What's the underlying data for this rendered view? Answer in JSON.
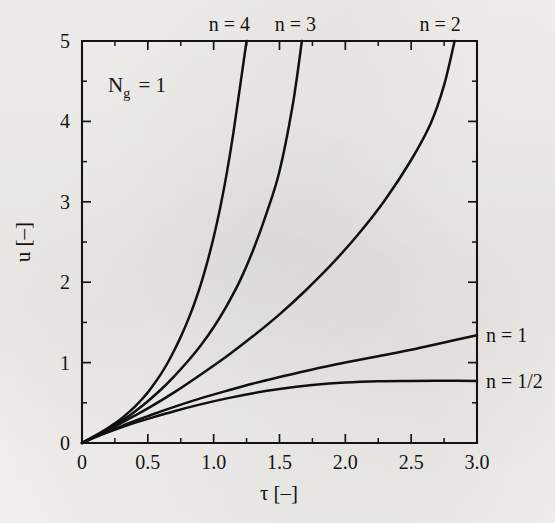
{
  "chart_data": {
    "type": "line",
    "title": "",
    "subtitle": "",
    "xlabel": "τ [–]",
    "ylabel": "u [–]",
    "xlim": [
      0,
      3.0
    ],
    "ylim": [
      0,
      5
    ],
    "grid": false,
    "legend_position": "inline-labels",
    "annotations": [
      {
        "name": "parameter-annotation",
        "text": "N",
        "subscript": "g",
        "suffix": "= 1",
        "full_text": "N_g = 1",
        "x": 0.33,
        "y": 4.55
      }
    ],
    "x_ticks": [
      0,
      0.5,
      1.0,
      1.5,
      2.0,
      2.5,
      3.0
    ],
    "x_tick_labels": [
      "0",
      "0.5",
      "1.0",
      "1.5",
      "2.0",
      "2.5",
      "3.0"
    ],
    "x_minor_ticks": [
      0.25,
      0.75,
      1.25,
      1.75,
      2.25,
      2.75
    ],
    "y_ticks": [
      0,
      1,
      2,
      3,
      4,
      5
    ],
    "y_tick_labels": [
      "0",
      "1",
      "2",
      "3",
      "4",
      "5"
    ],
    "y_minor_ticks": [
      0.5,
      1.5,
      2.5,
      3.5,
      4.5
    ],
    "series": [
      {
        "name": "n = 4",
        "label": "n = 4",
        "label_position": "top",
        "label_x": 1.12,
        "exit_x": 1.25,
        "x": [
          0,
          0.05,
          0.1,
          0.15,
          0.2,
          0.25,
          0.3,
          0.35,
          0.4,
          0.45,
          0.5,
          0.55,
          0.6,
          0.65,
          0.7,
          0.75,
          0.8,
          0.85,
          0.9,
          0.95,
          1.0,
          1.05,
          1.1,
          1.15,
          1.2,
          1.25
        ],
        "y": [
          0,
          0.047,
          0.093,
          0.14,
          0.19,
          0.245,
          0.305,
          0.375,
          0.45,
          0.535,
          0.63,
          0.74,
          0.86,
          0.995,
          1.15,
          1.32,
          1.51,
          1.72,
          1.96,
          2.24,
          2.56,
          2.93,
          3.36,
          3.86,
          4.43,
          5.0
        ]
      },
      {
        "name": "n = 3",
        "label": "n = 3",
        "label_position": "top",
        "label_x": 1.62,
        "exit_x": 1.67,
        "x": [
          0,
          0.1,
          0.2,
          0.3,
          0.4,
          0.5,
          0.6,
          0.7,
          0.8,
          0.9,
          1.0,
          1.1,
          1.2,
          1.3,
          1.4,
          1.5,
          1.6,
          1.67
        ],
        "y": [
          0,
          0.085,
          0.175,
          0.275,
          0.39,
          0.52,
          0.665,
          0.83,
          1.01,
          1.21,
          1.44,
          1.71,
          2.02,
          2.4,
          2.85,
          3.38,
          4.2,
          5.0
        ]
      },
      {
        "name": "n = 2",
        "label": "n = 2",
        "label_position": "top",
        "label_x": 2.72,
        "exit_x": 2.83,
        "x": [
          0,
          0.1,
          0.2,
          0.3,
          0.4,
          0.5,
          0.7,
          0.9,
          1.1,
          1.3,
          1.5,
          1.7,
          1.9,
          2.1,
          2.3,
          2.5,
          2.65,
          2.75,
          2.83
        ],
        "y": [
          0,
          0.08,
          0.16,
          0.25,
          0.34,
          0.43,
          0.63,
          0.85,
          1.08,
          1.33,
          1.6,
          1.9,
          2.23,
          2.6,
          3.02,
          3.52,
          3.98,
          4.45,
          5.0
        ]
      },
      {
        "name": "n = 1",
        "label": "n = 1",
        "label_position": "right",
        "label_y": 1.34,
        "x": [
          0,
          0.1,
          0.2,
          0.3,
          0.4,
          0.5,
          0.7,
          0.9,
          1.1,
          1.3,
          1.5,
          1.75,
          2.0,
          2.25,
          2.5,
          2.75,
          3.0
        ],
        "y": [
          0,
          0.075,
          0.145,
          0.21,
          0.275,
          0.335,
          0.45,
          0.555,
          0.65,
          0.74,
          0.82,
          0.915,
          1.0,
          1.08,
          1.16,
          1.25,
          1.34
        ]
      },
      {
        "name": "n = 1/2",
        "label": "n = 1/2",
        "label_position": "right",
        "label_y": 0.77,
        "x": [
          0,
          0.1,
          0.2,
          0.3,
          0.4,
          0.5,
          0.7,
          0.9,
          1.1,
          1.3,
          1.5,
          1.75,
          2.0,
          2.25,
          2.5,
          2.75,
          3.0
        ],
        "y": [
          0,
          0.07,
          0.135,
          0.195,
          0.25,
          0.3,
          0.395,
          0.48,
          0.555,
          0.62,
          0.672,
          0.72,
          0.752,
          0.768,
          0.772,
          0.773,
          0.772
        ]
      }
    ],
    "colors": {
      "curve": "#101010",
      "axis": "#141414",
      "background": "#f2f1ee"
    }
  }
}
